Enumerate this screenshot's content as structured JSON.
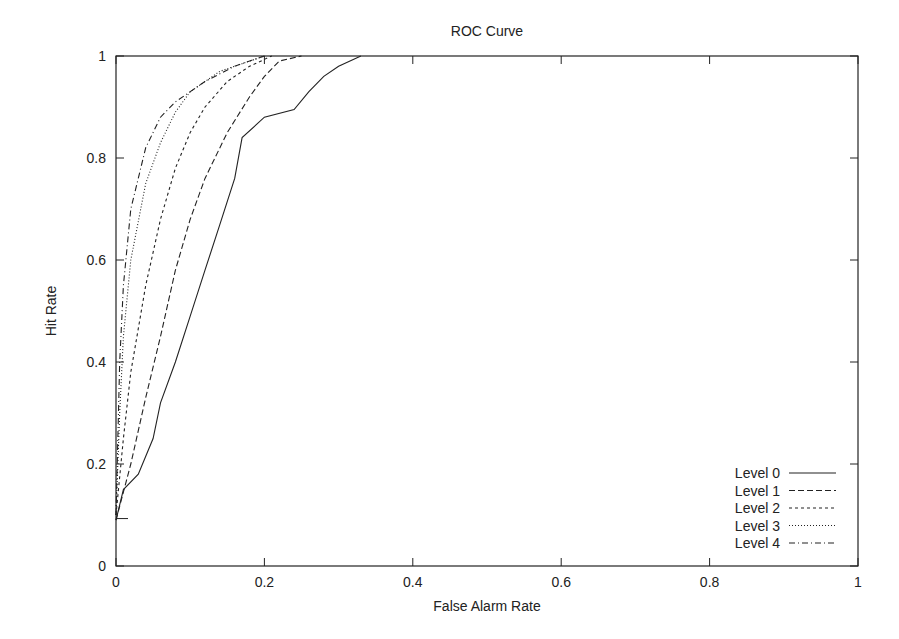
{
  "chart_data": {
    "type": "line",
    "title": "ROC Curve",
    "xlabel": "False Alarm Rate",
    "ylabel": "Hit Rate",
    "xlim": [
      0,
      1
    ],
    "ylim": [
      0,
      1
    ],
    "xticks": [
      "0",
      "0.2",
      "0.4",
      "0.6",
      "0.8",
      "1"
    ],
    "yticks": [
      "0",
      "0.2",
      "0.4",
      "0.6",
      "0.8",
      "1"
    ],
    "grid": false,
    "legend_position": "lower right",
    "series": [
      {
        "name": "Level 0",
        "style": "solid",
        "x": [
          0,
          0.01,
          0.03,
          0.05,
          0.06,
          0.08,
          0.1,
          0.12,
          0.14,
          0.16,
          0.17,
          0.2,
          0.24,
          0.26,
          0.28,
          0.3,
          0.33
        ],
        "y": [
          0.09,
          0.15,
          0.18,
          0.25,
          0.32,
          0.4,
          0.49,
          0.58,
          0.67,
          0.76,
          0.84,
          0.88,
          0.895,
          0.93,
          0.96,
          0.98,
          1.0
        ]
      },
      {
        "name": "Level 1",
        "style": "dashed",
        "x": [
          0,
          0.02,
          0.04,
          0.06,
          0.08,
          0.1,
          0.12,
          0.15,
          0.18,
          0.2,
          0.22,
          0.25
        ],
        "y": [
          0.09,
          0.2,
          0.33,
          0.45,
          0.58,
          0.68,
          0.76,
          0.85,
          0.92,
          0.96,
          0.99,
          1.0
        ]
      },
      {
        "name": "Level 2",
        "style": "short-dashed",
        "x": [
          0,
          0.01,
          0.02,
          0.04,
          0.06,
          0.08,
          0.1,
          0.12,
          0.15,
          0.18,
          0.21
        ],
        "y": [
          0.1,
          0.25,
          0.38,
          0.55,
          0.68,
          0.78,
          0.85,
          0.9,
          0.95,
          0.98,
          1.0
        ]
      },
      {
        "name": "Level 3",
        "style": "dotted",
        "x": [
          0,
          0.005,
          0.01,
          0.02,
          0.04,
          0.06,
          0.08,
          0.1,
          0.14,
          0.18,
          0.2
        ],
        "y": [
          0.1,
          0.3,
          0.45,
          0.6,
          0.75,
          0.83,
          0.89,
          0.93,
          0.97,
          0.99,
          1.0
        ]
      },
      {
        "name": "Level 4",
        "style": "dash-dot",
        "x": [
          0,
          0.005,
          0.01,
          0.02,
          0.04,
          0.06,
          0.08,
          0.12,
          0.16,
          0.2
        ],
        "y": [
          0.1,
          0.4,
          0.55,
          0.7,
          0.82,
          0.88,
          0.91,
          0.95,
          0.98,
          1.0
        ]
      }
    ]
  },
  "colors": {
    "line": "#222222",
    "axis": "#222222",
    "background": "#ffffff"
  }
}
